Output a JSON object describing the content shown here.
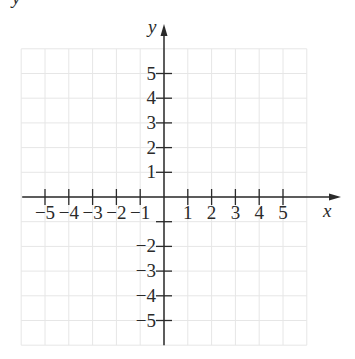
{
  "corner_fragment": "y",
  "chart_data": {
    "type": "coordinate-plane",
    "title": "",
    "xlabel": "x",
    "ylabel": "y",
    "xlim": [
      -6,
      6
    ],
    "ylim": [
      -6,
      6
    ],
    "grid": true,
    "x_tick_labels": [
      "-5",
      "-4",
      "-3",
      "-2",
      "-1",
      "1",
      "2",
      "3",
      "4",
      "5"
    ],
    "y_tick_labels": [
      "5",
      "4",
      "3",
      "2",
      "1",
      "-2",
      "-3",
      "-4",
      "-5"
    ],
    "x_ticks": [
      -5,
      -4,
      -3,
      -2,
      -1,
      1,
      2,
      3,
      4,
      5
    ],
    "y_ticks": [
      5,
      4,
      3,
      2,
      1,
      -1,
      -2,
      -3,
      -4,
      -5
    ],
    "series": []
  },
  "colors": {
    "grid": "#e6e6e6",
    "axis": "#2a2a2a",
    "text": "#2a2a2a"
  }
}
